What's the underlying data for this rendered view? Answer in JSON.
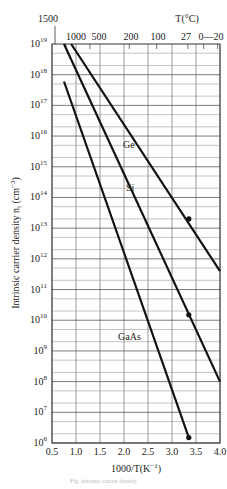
{
  "chart_data": {
    "type": "line",
    "title": "",
    "xlabel": "1000/T(K^-1)",
    "ylabel": "Intrinsic carrier density n_i (cm^-3)",
    "top_axis_label": "T(°C)",
    "x_ticks": [
      "0.5",
      "1.0",
      "1.5",
      "2.0",
      "2.5",
      "3.0",
      "3.5",
      "4.0"
    ],
    "x_tick_values": [
      0.5,
      1.0,
      1.5,
      2.0,
      2.5,
      3.0,
      3.5,
      4.0
    ],
    "xlim": [
      0.5,
      4.0
    ],
    "y_scale": "log",
    "ylim": [
      1000000.0,
      1e+19
    ],
    "y_tick_exponents": [
      19,
      18,
      17,
      16,
      15,
      14,
      13,
      12,
      11,
      10,
      9,
      8,
      7,
      6
    ],
    "top_ticks": [
      {
        "label": "1500",
        "x": 0.56
      },
      {
        "label": "1000",
        "x": 0.79
      },
      {
        "label": "500",
        "x": 1.29
      },
      {
        "label": "200",
        "x": 2.11
      },
      {
        "label": "100",
        "x": 2.68
      },
      {
        "label": "27",
        "x": 3.33
      },
      {
        "label": "0",
        "x": 3.66
      },
      {
        "label": "-20",
        "x": 3.95
      }
    ],
    "grid": true,
    "series": [
      {
        "name": "Ge",
        "x": [
          0.9,
          4.0
        ],
        "y": [
          1e+19,
          400000000000.0
        ],
        "marker": {
          "x": 3.35,
          "y": 20000000000000.0
        },
        "label_pos": {
          "x": 2.05,
          "y": 3e+16
        }
      },
      {
        "name": "Si",
        "x": [
          0.75,
          4.0
        ],
        "y": [
          1e+19,
          100000000.0
        ],
        "marker": {
          "x": 3.35,
          "y": 15000000000.0
        },
        "label_pos": {
          "x": 2.1,
          "y": 200000000000000.0
        }
      },
      {
        "name": "GaAs",
        "x": [
          0.75,
          3.35
        ],
        "y": [
          6e+17,
          1500000.0
        ],
        "marker": {
          "x": 3.35,
          "y": 1500000.0
        },
        "label_pos": {
          "x": 1.9,
          "y": 3000000000.0
        }
      }
    ]
  },
  "labels": {
    "xlabel": "1000/T(K",
    "xlabel_exp": "−1",
    "xlabel_close": ")",
    "ylabel": "Intrinsic carrier density n",
    "ylabel_sub": "i",
    "ylabel_unit": " (cm",
    "ylabel_exp": "−3",
    "ylabel_close": ")",
    "top_axis_label": "T(°C)",
    "top_tick_1500": "1500",
    "top_ticks_row": [
      "1000",
      "500",
      "200",
      "100",
      "27",
      "0—20"
    ],
    "series_ge": "Ge",
    "series_si": "Si",
    "series_gaas": "GaAs",
    "caption": "Fig. intrinsic carrier density"
  }
}
